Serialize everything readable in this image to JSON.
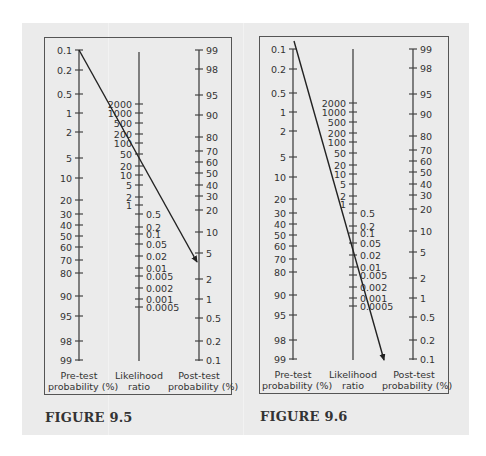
{
  "figures": [
    {
      "label": "FIGURE 9.5",
      "axes": {
        "pretest": {
          "caption_line1": "Pre-test",
          "caption_line2": "probability (%)",
          "ticks": [
            "0.1",
            "0.2",
            "0.5",
            "1",
            "2",
            "5",
            "10",
            "20",
            "30",
            "40",
            "50",
            "60",
            "70",
            "80",
            "90",
            "95",
            "98",
            "99"
          ]
        },
        "likelihood": {
          "caption_line1": "Likelihood",
          "caption_line2": "ratio",
          "ticks_upper": [
            "2000",
            "1000",
            "500",
            "200",
            "100",
            "50",
            "20",
            "10",
            "5",
            "2",
            "1"
          ],
          "ticks_lower": [
            "0.5",
            "0.2",
            "0.1",
            "0.05",
            "0.02",
            "0.01",
            "0.005",
            "0.002",
            "0.001",
            "0.0005"
          ]
        },
        "posttest": {
          "caption_line1": "Post-test",
          "caption_line2": "probability (%)",
          "ticks": [
            "99",
            "98",
            "95",
            "90",
            "80",
            "70",
            "60",
            "50",
            "40",
            "30",
            "20",
            "10",
            "5",
            "2",
            "1",
            "0.5",
            "0.2",
            "0.1"
          ]
        }
      },
      "arrow": {
        "from_pretest": "0.1",
        "through_lr": "50",
        "to_posttest": "≈4"
      }
    },
    {
      "label": "FIGURE 9.6",
      "axes": {
        "pretest": {
          "caption_line1": "Pre-test",
          "caption_line2": "probability (%)",
          "ticks": [
            "0.1",
            "0.2",
            "0.5",
            "1",
            "2",
            "5",
            "10",
            "20",
            "30",
            "40",
            "50",
            "60",
            "70",
            "80",
            "90",
            "95",
            "98",
            "99"
          ]
        },
        "likelihood": {
          "caption_line1": "Likelihood",
          "caption_line2": "ratio",
          "ticks_upper": [
            "2000",
            "1000",
            "500",
            "200",
            "100",
            "50",
            "20",
            "10",
            "5",
            "2",
            "1"
          ],
          "ticks_lower": [
            "0.5",
            "0.2",
            "0.1",
            "0.05",
            "0.02",
            "0.01",
            "0.005",
            "0.002",
            "0.001",
            "0.0005"
          ]
        },
        "posttest": {
          "caption_line1": "Post-test",
          "caption_line2": "probability (%)",
          "ticks": [
            "99",
            "98",
            "95",
            "90",
            "80",
            "70",
            "60",
            "50",
            "40",
            "30",
            "20",
            "10",
            "5",
            "2",
            "1",
            "0.5",
            "0.2",
            "0.1"
          ]
        }
      },
      "arrow": {
        "from_pretest": "<0.1",
        "through_lr": "0.05",
        "to_posttest": "<0.1"
      }
    }
  ]
}
